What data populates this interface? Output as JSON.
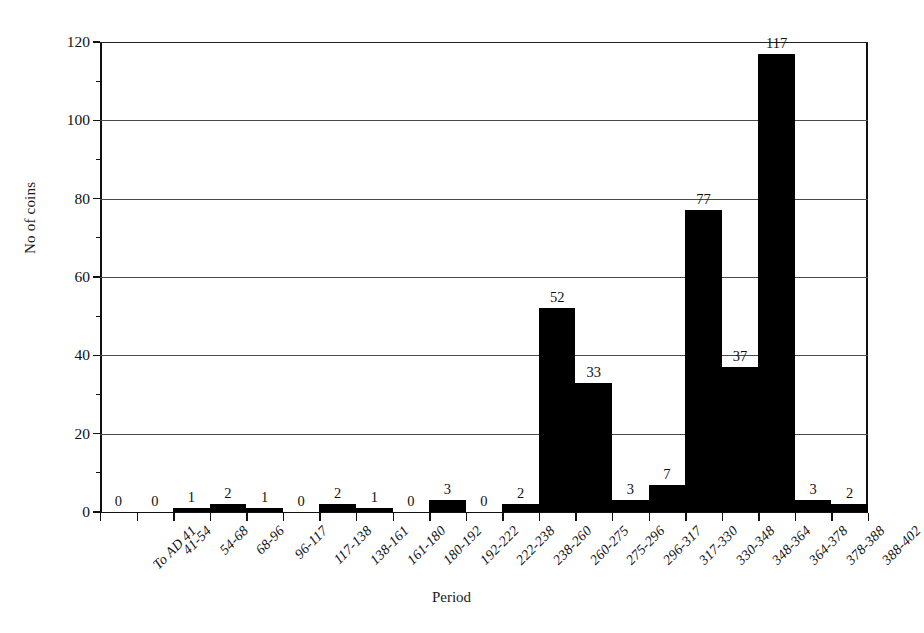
{
  "chart_data": {
    "type": "bar",
    "title": "",
    "xlabel": "Period",
    "ylabel": "No of coins",
    "ylim": [
      0,
      120
    ],
    "ytick_values": [
      0,
      20,
      40,
      60,
      80,
      100,
      120
    ],
    "ytick_labels": [
      "0",
      "20",
      "40",
      "60",
      "80",
      "100",
      "120"
    ],
    "grid": true,
    "legend": null,
    "bar_color": "#000000",
    "show_value_labels": true,
    "categories": [
      "To AD 41",
      "41-54",
      "54-68",
      "68-96",
      "96-117",
      "117-138",
      "138-161",
      "161-180",
      "180-192",
      "192-222",
      "222-238",
      "238-260",
      "260-275",
      "275-296",
      "296-317",
      "317-330",
      "330-348",
      "348-364",
      "364-378",
      "378-388",
      "388-402"
    ],
    "values": [
      0,
      0,
      1,
      2,
      1,
      0,
      2,
      1,
      0,
      3,
      0,
      2,
      52,
      33,
      3,
      7,
      77,
      37,
      117,
      3,
      2
    ],
    "value_labels": [
      "0",
      "0",
      "1",
      "2",
      "1",
      "0",
      "2",
      "1",
      "0",
      "3",
      "0",
      "2",
      "52",
      "33",
      "3",
      "7",
      "77",
      "37",
      "117",
      "3",
      "2"
    ]
  }
}
